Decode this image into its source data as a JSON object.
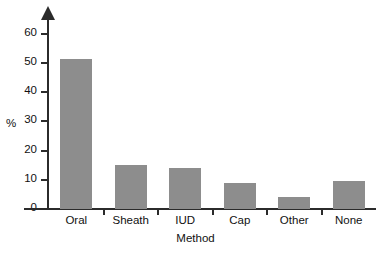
{
  "chart_data": {
    "type": "bar",
    "title": "",
    "subtitle": "",
    "xlabel": "Method",
    "ylabel": "%",
    "categories": [
      "Oral",
      "Sheath",
      "IUD",
      "Cap",
      "Other",
      "None"
    ],
    "values": [
      51,
      15,
      14,
      9,
      4,
      9.5
    ],
    "ylim": [
      0,
      65
    ],
    "yticks": [
      0,
      10,
      20,
      30,
      40,
      50,
      60
    ],
    "ytick_labels": [
      "0",
      "10",
      "20",
      "30",
      "40",
      "50",
      "60"
    ],
    "grid": false,
    "legend": null,
    "bar_color": "#8d8d8d",
    "axis_color": "#2b2b2b",
    "text_color": "#111111",
    "background": "#ffffff"
  }
}
